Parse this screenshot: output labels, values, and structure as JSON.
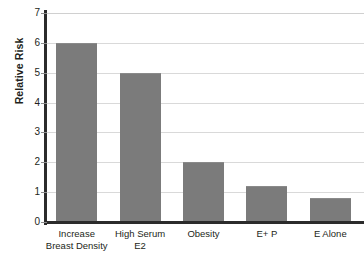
{
  "chart_data": {
    "type": "bar",
    "title": "",
    "xlabel": "",
    "ylabel": "Relative Risk",
    "ylim": [
      0,
      7
    ],
    "ytick_values": [
      0,
      1,
      2,
      3,
      4,
      5,
      6,
      7
    ],
    "ytick_labels": [
      "0",
      "1",
      "2",
      "3",
      "4",
      "5",
      "6",
      "7"
    ],
    "grid": true,
    "grid_axis": "y",
    "legend": false,
    "bar_color": "#7b7b7b",
    "axis_color": "#2b2b2b",
    "grid_color": "#d9d9d9",
    "categories": [
      "Increase Breast Density",
      "High Serum E2",
      "Obesity",
      "E+ P",
      "E Alone"
    ],
    "category_lines": [
      [
        "Increase",
        "Breast Density"
      ],
      [
        "High Serum",
        "E2"
      ],
      [
        "Obesity",
        ""
      ],
      [
        "E+ P",
        ""
      ],
      [
        "E Alone",
        ""
      ]
    ],
    "values": [
      6.0,
      5.0,
      2.0,
      1.2,
      0.8
    ]
  }
}
